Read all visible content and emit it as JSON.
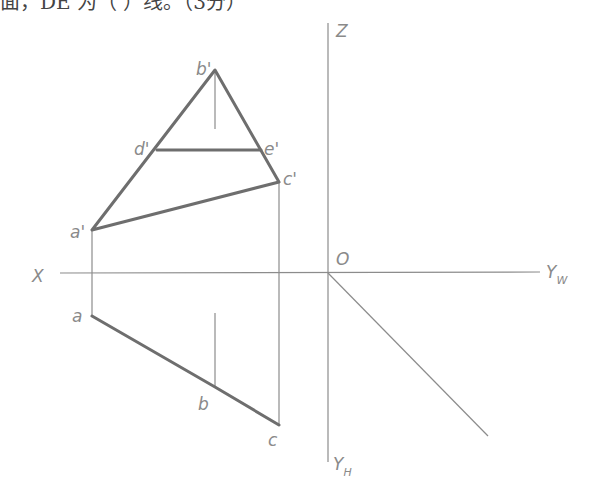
{
  "question": {
    "text": "面，DE 为（    ）线。（3分）"
  },
  "axes": {
    "x_label": "X",
    "z_label": "Z",
    "origin_label": "O",
    "yw_label": "Y",
    "yw_sub": "W",
    "yh_label": "Y",
    "yh_sub": "H"
  },
  "points": {
    "a_prime": "a'",
    "b_prime": "b'",
    "c_prime": "c'",
    "d_prime": "d'",
    "e_prime": "e'",
    "a": "a",
    "b": "b",
    "c": "c"
  },
  "colors": {
    "thick_line": "#6e6e6e",
    "thin_line": "#8c8c8c",
    "label": "#8a8a8a"
  }
}
